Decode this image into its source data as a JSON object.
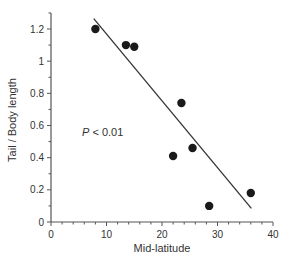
{
  "chart_data": {
    "type": "scatter",
    "title": "",
    "xlabel": "Mid-latitude",
    "ylabel": "Tail / Body length",
    "xlim": [
      0,
      40
    ],
    "ylim": [
      0,
      1.3
    ],
    "xticks": [
      0,
      10,
      20,
      30,
      40
    ],
    "xtick_labels": [
      "0",
      "10",
      "20",
      "30",
      "40"
    ],
    "yticks": [
      0,
      0.2,
      0.4,
      0.6,
      0.8,
      1,
      1.2
    ],
    "ytick_labels": [
      "0",
      "0.2",
      "0.4",
      "0.6",
      "0.8",
      "1",
      "1.2"
    ],
    "grid": false,
    "legend": null,
    "series": [
      {
        "name": "observations",
        "points": [
          {
            "x": 8,
            "y": 1.2
          },
          {
            "x": 13.5,
            "y": 1.1
          },
          {
            "x": 15,
            "y": 1.09
          },
          {
            "x": 22,
            "y": 0.41
          },
          {
            "x": 23.5,
            "y": 0.74
          },
          {
            "x": 25.5,
            "y": 0.46
          },
          {
            "x": 28.5,
            "y": 0.1
          },
          {
            "x": 36,
            "y": 0.18
          }
        ]
      }
    ],
    "fit_line": {
      "x1": 7.7,
      "y1": 1.265,
      "x2": 36.1,
      "y2": 0.085
    },
    "annotations": [
      {
        "text_italic": "P",
        "text": " < 0.01",
        "x": 5.5,
        "y": 0.55
      }
    ],
    "colors": {
      "points": "#1a1a1a",
      "line": "#333333",
      "axis": "#555555"
    }
  }
}
